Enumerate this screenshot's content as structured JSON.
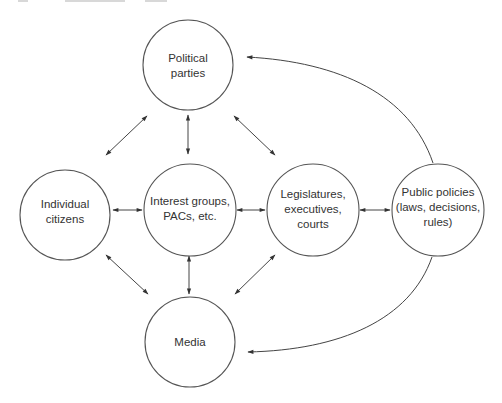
{
  "diagram": {
    "type": "network",
    "nodes": [
      {
        "id": "parties",
        "lines": [
          "Political",
          "parties"
        ],
        "cx": 188,
        "cy": 65,
        "r": 45
      },
      {
        "id": "citizens",
        "lines": [
          "Individual",
          "citizens"
        ],
        "cx": 65,
        "cy": 215,
        "r": 45
      },
      {
        "id": "interest",
        "lines": [
          "Interest groups,",
          "PACs, etc."
        ],
        "cx": 190,
        "cy": 210,
        "r": 46
      },
      {
        "id": "legislatures",
        "lines": [
          "Legislatures,",
          "executives,",
          "courts"
        ],
        "cx": 313,
        "cy": 210,
        "r": 46
      },
      {
        "id": "policies",
        "lines": [
          "Public policies",
          "(laws, decisions,",
          "rules)"
        ],
        "cx": 438,
        "cy": 210,
        "r": 46
      },
      {
        "id": "media",
        "lines": [
          "Media"
        ],
        "cx": 190,
        "cy": 342,
        "r": 45
      }
    ],
    "edges": [
      {
        "from": "citizens",
        "to": "parties",
        "bidirectional": true
      },
      {
        "from": "interest",
        "to": "parties",
        "bidirectional": true
      },
      {
        "from": "legislatures",
        "to": "parties",
        "bidirectional": true
      },
      {
        "from": "citizens",
        "to": "interest",
        "bidirectional": true
      },
      {
        "from": "interest",
        "to": "legislatures",
        "bidirectional": true
      },
      {
        "from": "legislatures",
        "to": "policies",
        "bidirectional": true
      },
      {
        "from": "citizens",
        "to": "media",
        "bidirectional": true
      },
      {
        "from": "interest",
        "to": "media",
        "bidirectional": true
      },
      {
        "from": "legislatures",
        "to": "media",
        "bidirectional": true
      },
      {
        "from": "policies",
        "to": "parties",
        "bidirectional": false,
        "curved": true
      },
      {
        "from": "policies",
        "to": "media",
        "bidirectional": false,
        "curved": true
      }
    ]
  }
}
